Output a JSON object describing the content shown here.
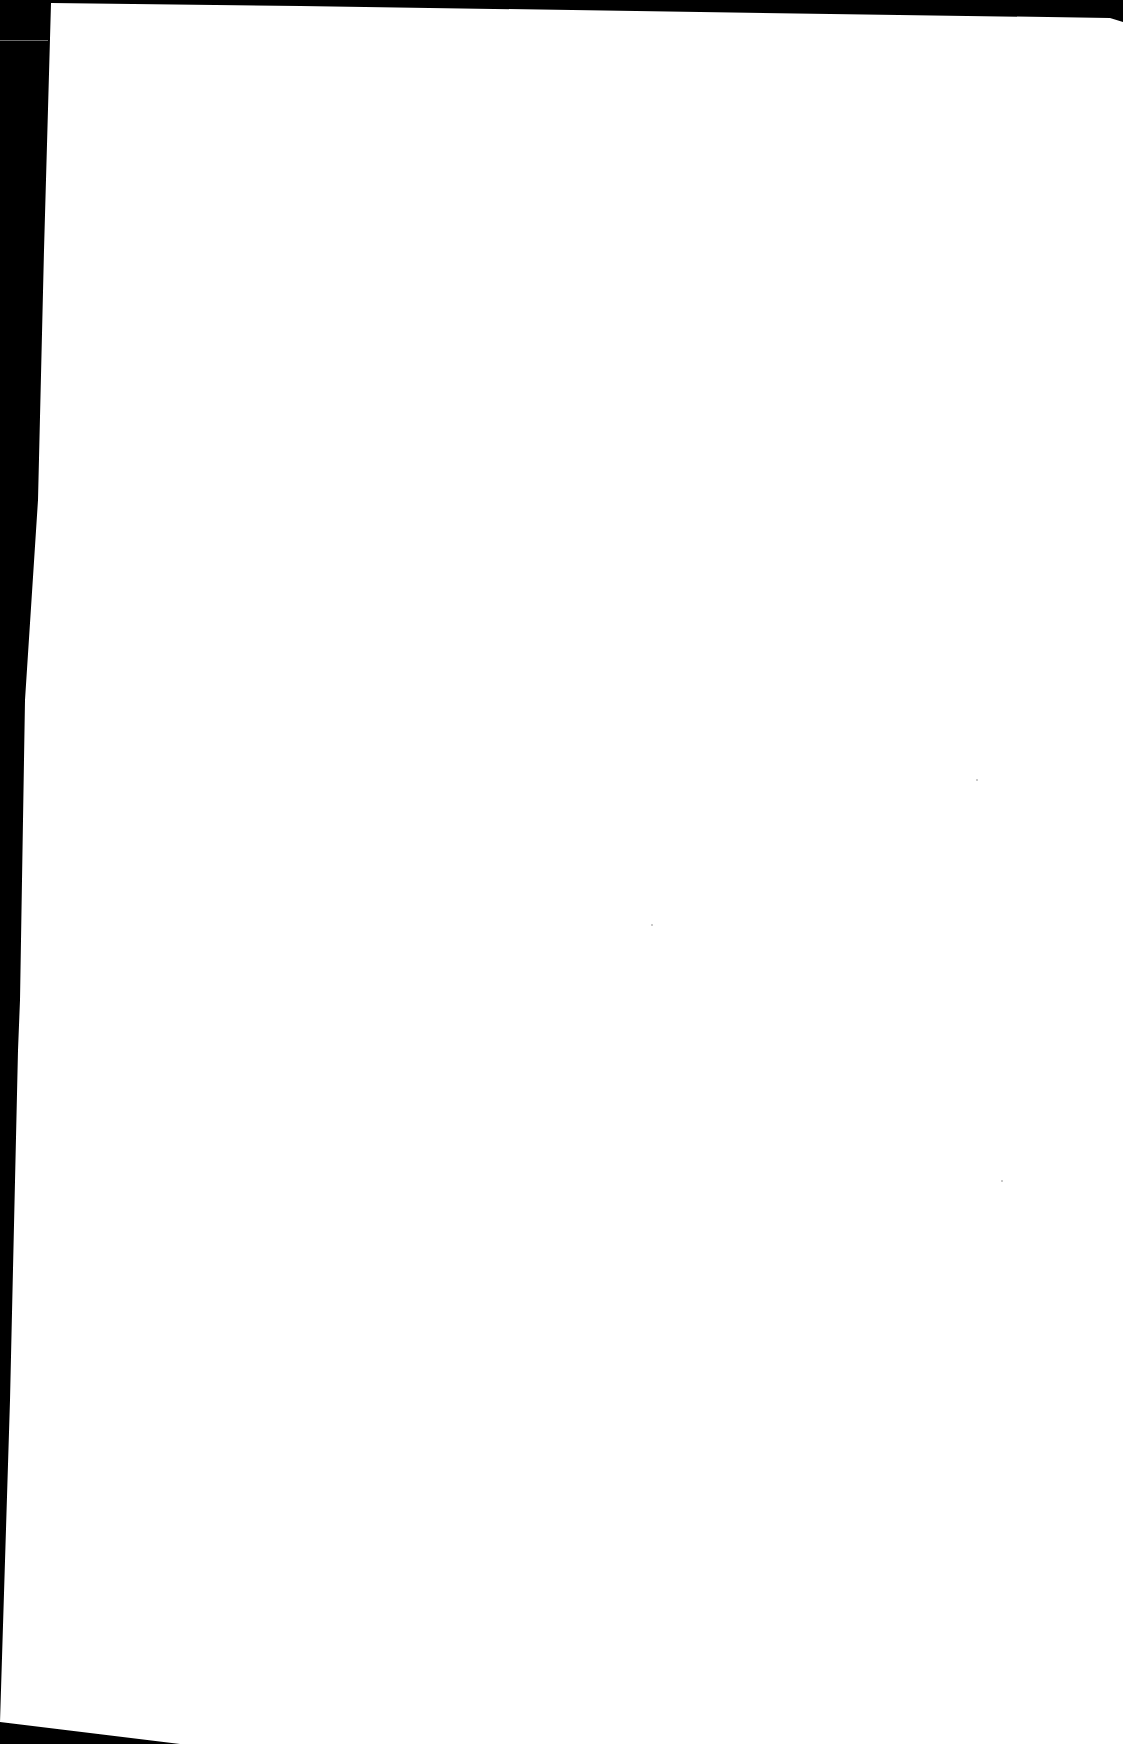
{
  "document": {
    "type": "scanned-page",
    "content": "",
    "is_blank": true
  },
  "colors": {
    "background": "#000000",
    "page": "#ffffff"
  }
}
